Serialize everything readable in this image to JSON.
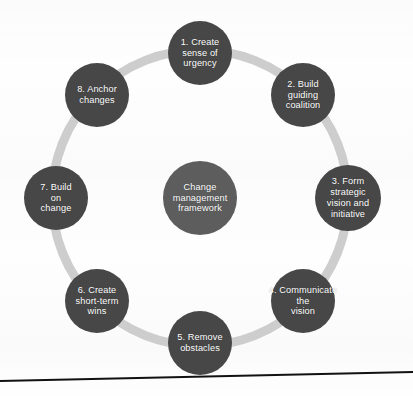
{
  "diagram": {
    "type": "cycle",
    "title": "Change management framework",
    "hub": {
      "label": "Change\nmanagement\nframework",
      "name": "hub-node",
      "color": "#5d5d5d",
      "cx": 200,
      "cy": 198,
      "r": 37
    },
    "ring": {
      "color": "#cdcdcd",
      "cx": 200,
      "cy": 198,
      "r": 148,
      "stroke_width": 9
    },
    "node_color": "#474747",
    "node_radius": 32,
    "steps": [
      {
        "number": "1",
        "label": "1. Create\nsense of\nurgency",
        "name": "step-1-create-sense-of-urgency",
        "cx": 200,
        "cy": 53,
        "r": 32
      },
      {
        "number": "2",
        "label": "2. Build\nguiding\ncoalition",
        "name": "step-2-build-guiding-coalition",
        "cx": 303,
        "cy": 95,
        "r": 32
      },
      {
        "number": "3",
        "label": "3. Form\nstrategic\nvision and\ninitiative",
        "name": "step-3-form-strategic-vision",
        "cx": 348,
        "cy": 198,
        "r": 33
      },
      {
        "number": "4",
        "label": "4. Communicate\nthe\nvision",
        "name": "step-4-communicate-the-vision",
        "cx": 303,
        "cy": 301,
        "r": 32
      },
      {
        "number": "5",
        "label": "5. Remove\nobstacles",
        "name": "step-5-remove-obstacles",
        "cx": 200,
        "cy": 343,
        "r": 32
      },
      {
        "number": "6",
        "label": "6. Create\nshort-term\nwins",
        "name": "step-6-create-short-term-wins",
        "cx": 97,
        "cy": 301,
        "r": 32
      },
      {
        "number": "7",
        "label": "7. Build\non\nchange",
        "name": "step-7-build-on-change",
        "cx": 56,
        "cy": 198,
        "r": 32
      },
      {
        "number": "8",
        "label": "8. Anchor\nchanges",
        "name": "step-8-anchor-changes",
        "cx": 97,
        "cy": 95,
        "r": 32
      }
    ],
    "footer_rule": {
      "name": "bottom-divider",
      "color": "#111111",
      "x1": 0,
      "y1": 381,
      "x2": 413,
      "y2": 372,
      "stroke_width": 2
    }
  }
}
